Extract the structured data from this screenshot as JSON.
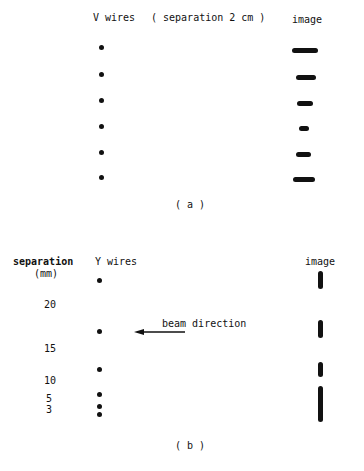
{
  "panel_a": {
    "title": "V wires",
    "note": "( separation 2 cm )",
    "image_label": "image",
    "caption": "( a )",
    "wires": [
      {
        "y": 47,
        "image_width": 26
      },
      {
        "y": 74,
        "image_width": 20
      },
      {
        "y": 100,
        "image_width": 16
      },
      {
        "y": 126,
        "image_width": 10
      },
      {
        "y": 152,
        "image_width": 15
      },
      {
        "y": 177,
        "image_width": 22
      }
    ]
  },
  "panel_b": {
    "axis_label": "separation",
    "axis_unit": "(mm)",
    "title": "Y wires",
    "image_label": "image",
    "arrow_label": "beam direction",
    "caption": "( b )",
    "ticks": [
      "20",
      "15",
      "10",
      "5",
      "3"
    ],
    "wires_y": [
      280,
      331,
      369,
      394,
      406,
      414
    ],
    "images": [
      {
        "top": 271,
        "height": 18
      },
      {
        "top": 320,
        "height": 18
      },
      {
        "top": 362,
        "height": 15
      },
      {
        "top": 386,
        "height": 36
      }
    ]
  }
}
